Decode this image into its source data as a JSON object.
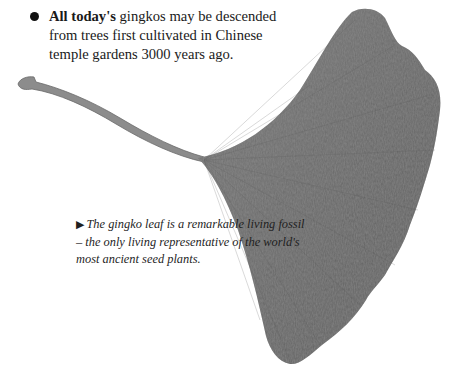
{
  "fact": {
    "bullet_icon": "filled-circle-bullet",
    "bold_lead": "All today's",
    "body": " gingkos may be descended from trees first cultivated in Chinese temple gardens 3000 years ago."
  },
  "illustration": {
    "subject": "gingko-leaf",
    "fill_color": "#6f6f6f",
    "stem_color": "#8a8a8a",
    "vein_color": "#5a5a5a"
  },
  "caption": {
    "arrow_icon": "▶",
    "text": "The gingko leaf is a remarkable living fossil – the only living representative of the world's most ancient seed plants."
  }
}
